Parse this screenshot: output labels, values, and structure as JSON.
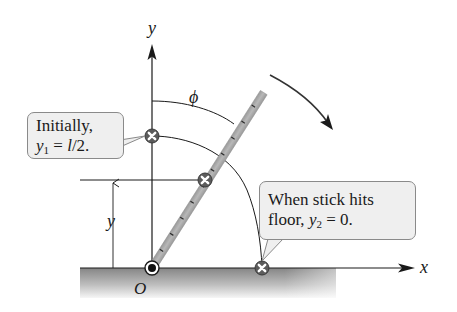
{
  "diagram": {
    "axes": {
      "x_label": "x",
      "y_label": "y",
      "origin_label": "O"
    },
    "angle_label": "ϕ",
    "height_label": "y",
    "callouts": {
      "initial": {
        "line1": "Initially,",
        "var": "y",
        "sub": "1",
        "rest": " = ",
        "value_var": "l",
        "value_rest": "/2."
      },
      "final": {
        "line1": "When stick hits",
        "prefix": "floor, ",
        "var": "y",
        "sub": "2",
        "rest": " = 0."
      }
    },
    "markers": [
      {
        "name": "initial-center-of-mass",
        "x": 152,
        "y": 136
      },
      {
        "name": "current-center-of-mass",
        "x": 205,
        "y": 180
      },
      {
        "name": "final-center-of-mass",
        "x": 262,
        "y": 268
      }
    ],
    "colors": {
      "stick": "#a8a8a8",
      "floor_top": "#8c8c8c",
      "floor_bottom": "#f4f4f4",
      "callout_bg": "#efefef",
      "line": "#1a1a1a"
    }
  }
}
